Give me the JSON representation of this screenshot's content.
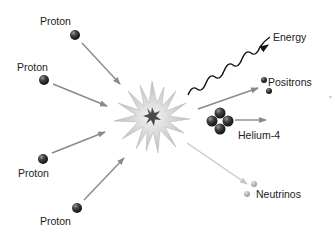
{
  "diagram": {
    "inputs": [
      {
        "label": "Proton"
      },
      {
        "label": "Proton"
      },
      {
        "label": "Proton"
      },
      {
        "label": "Proton"
      }
    ],
    "outputs": {
      "energy": "Energy",
      "positrons": "Positrons",
      "helium": "Helium-4",
      "neutrinos": "Neutrinos"
    },
    "colors": {
      "proton": "#3a3a3a",
      "arrow": "#8a8a8a",
      "neutrino_arrow": "#c8c8c8",
      "burst": "#c9c9c9",
      "core": "#444444"
    }
  }
}
